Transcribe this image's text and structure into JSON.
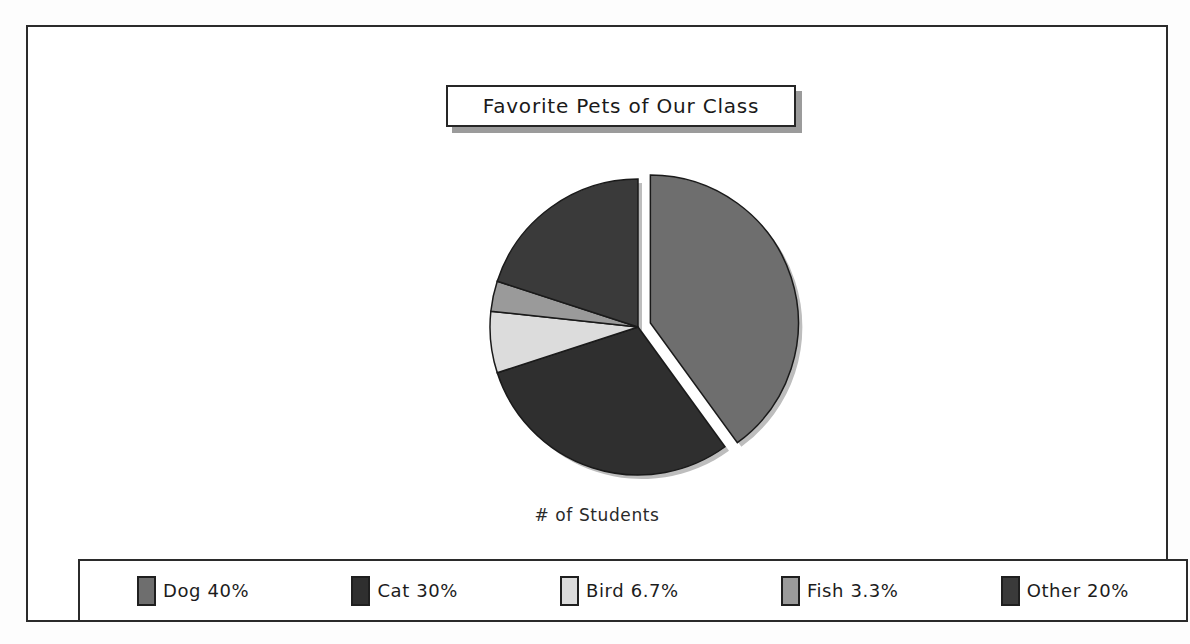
{
  "chart": {
    "title": "Favorite Pets of Our Class",
    "axis_label": "# of Students"
  },
  "legend": {
    "items": [
      {
        "label": "Dog  40%",
        "color": "#6e6e6e"
      },
      {
        "label": "Cat  30%",
        "color": "#2f2f2f"
      },
      {
        "label": "Bird  6.7%",
        "color": "#dcdcdc"
      },
      {
        "label": "Fish  3.3%",
        "color": "#9a9a9a"
      },
      {
        "label": "Other  20%",
        "color": "#3a3a3a"
      }
    ]
  },
  "chart_data": {
    "type": "pie",
    "title": "Favorite Pets of Our Class",
    "xlabel": "# of Students",
    "ylabel": "",
    "categories": [
      "Dog",
      "Cat",
      "Bird",
      "Fish",
      "Other"
    ],
    "values": [
      40,
      30,
      6.7,
      3.3,
      20
    ],
    "value_labels": [
      "40%",
      "30%",
      "6.7%",
      "3.3%",
      "20%"
    ],
    "units": "percent",
    "colors": [
      "#6e6e6e",
      "#2f2f2f",
      "#dcdcdc",
      "#9a9a9a",
      "#3a3a3a"
    ],
    "exploded": [
      "Dog"
    ],
    "start_angle_deg": 0,
    "direction": "clockwise",
    "legend_position": "bottom",
    "grid": false
  }
}
